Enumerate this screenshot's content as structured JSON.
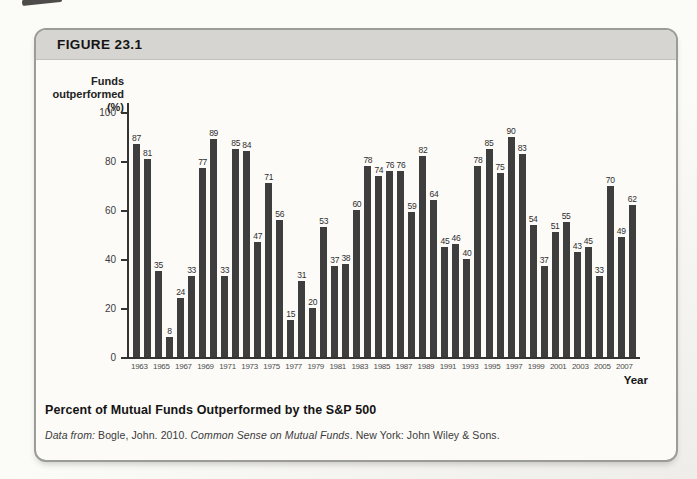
{
  "figure": {
    "label": "FIGURE 23.1"
  },
  "chart_data": {
    "type": "bar",
    "title": "Percent of Mutual Funds Outperformed by the S&P 500",
    "ylabel_lines": [
      "Funds",
      "outperformed (%)"
    ],
    "xlabel": "Year",
    "ylim": [
      0,
      100
    ],
    "yticks": [
      0,
      20,
      40,
      60,
      80,
      100
    ],
    "grid": false,
    "legend": "none",
    "bar_color": "#3e3e3e",
    "x_tick_labels_shown": "odd years 1963-2007",
    "categories": [
      1963,
      1964,
      1965,
      1966,
      1967,
      1968,
      1969,
      1970,
      1971,
      1972,
      1973,
      1974,
      1975,
      1976,
      1977,
      1978,
      1979,
      1980,
      1981,
      1982,
      1983,
      1984,
      1985,
      1986,
      1987,
      1988,
      1989,
      1990,
      1991,
      1992,
      1993,
      1994,
      1995,
      1996,
      1997,
      1998,
      1999,
      2000,
      2001,
      2002,
      2003,
      2004,
      2005,
      2006,
      2007,
      2008
    ],
    "values": [
      87,
      81,
      35,
      8,
      24,
      33,
      77,
      89,
      33,
      85,
      84,
      47,
      71,
      56,
      15,
      31,
      20,
      53,
      37,
      38,
      60,
      78,
      74,
      76,
      76,
      59,
      82,
      64,
      45,
      46,
      40,
      78,
      85,
      75,
      90,
      83,
      54,
      37,
      51,
      55,
      43,
      45,
      33,
      70,
      49,
      62
    ]
  },
  "caption": {
    "title": "Percent of Mutual Funds Outperformed by the S&P 500"
  },
  "source": {
    "label": "Data from:",
    "citation": " Bogle, John. 2010. ",
    "book_title": "Common Sense on Mutual Funds",
    "rest": ". New York: John Wiley & Sons."
  }
}
